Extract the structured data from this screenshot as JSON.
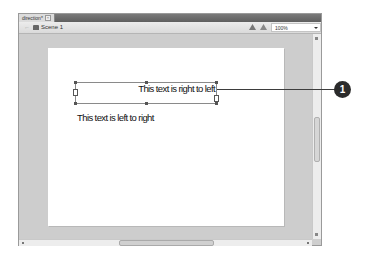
{
  "document_tab": {
    "label": "direction*",
    "close_glyph": "×"
  },
  "toolbar": {
    "back_glyph": "←",
    "scene_label": "Scene 1",
    "icons": [
      "edit-symbols-icon",
      "edit-scene-icon"
    ],
    "zoom_value": "100%"
  },
  "stage": {
    "text_rtl": "This text is right to left",
    "text_ltr": "This text is left to right"
  },
  "callout": {
    "number": "1"
  },
  "colors": {
    "callout": "#2b2b2b",
    "pasteboard": "#cdcdcd",
    "stage": "#ffffff"
  }
}
